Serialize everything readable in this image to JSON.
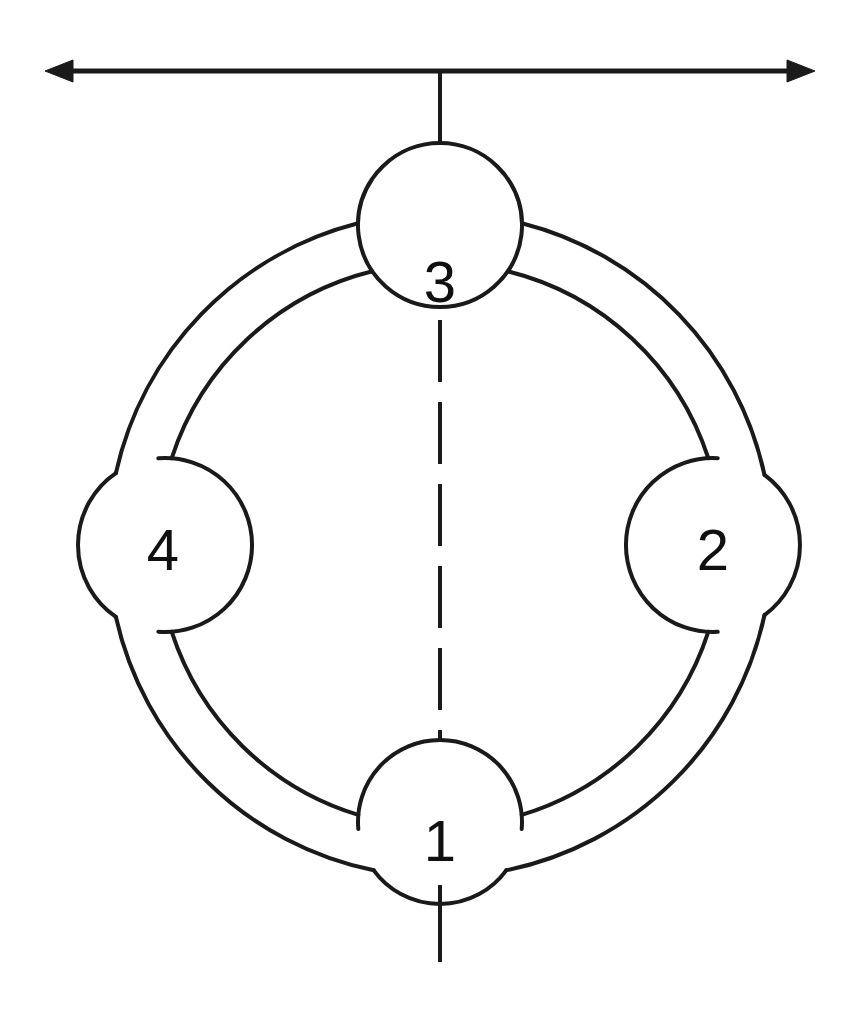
{
  "figure": {
    "kind": "technical-line-diagram",
    "background_color": "#ffffff",
    "stroke_color": "#1a1a1a",
    "label_color": "#101010",
    "canvas": {
      "width": 856,
      "height": 1014
    }
  },
  "ring": {
    "center": {
      "x": 440,
      "y": 545
    },
    "outer_radius": 332,
    "inner_radius": 282,
    "stroke_width": 4
  },
  "nodes": [
    {
      "id": "node-1",
      "label": "1",
      "position": "bottom",
      "center": {
        "x": 440,
        "y": 822
      },
      "radius": 82,
      "label_pos": {
        "x": 440,
        "y": 840
      }
    },
    {
      "id": "node-2",
      "label": "2",
      "position": "right",
      "center": {
        "x": 713,
        "y": 545
      },
      "radius": 87,
      "label_pos": {
        "x": 713,
        "y": 549
      }
    },
    {
      "id": "node-3",
      "label": "3",
      "position": "top",
      "center": {
        "x": 440,
        "y": 225
      },
      "radius": 82,
      "label_pos": {
        "x": 440,
        "y": 281
      }
    },
    {
      "id": "node-4",
      "label": "4",
      "position": "left",
      "center": {
        "x": 165,
        "y": 545
      },
      "radius": 87,
      "label_pos": {
        "x": 163,
        "y": 549
      }
    }
  ],
  "axis_arrow": {
    "name": "horizontal-double-arrow",
    "y": 71,
    "x_start": 45,
    "x_end": 815,
    "head_length": 28,
    "head_half_height": 11,
    "stroke_width": 5,
    "double_headed": true
  },
  "center_line": {
    "name": "vertical-center-line",
    "x": 440,
    "solid_top": {
      "y_start": 71,
      "y_end": 143
    },
    "dashed": {
      "y_start": 320,
      "y_end": 740,
      "dash": 62,
      "gap": 20
    },
    "solid_bottom": {
      "y_start": 885,
      "y_end": 962
    },
    "stroke_width": 4
  }
}
